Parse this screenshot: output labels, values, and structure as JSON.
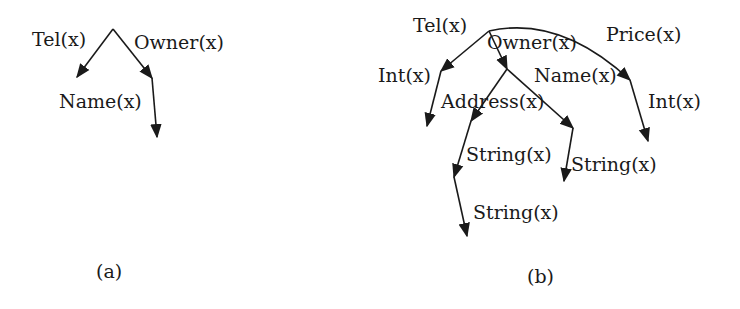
{
  "figure_a": {
    "caption": "(a)",
    "labels": {
      "tel": "Tel(x)",
      "owner": "Owner(x)",
      "name": "Name(x)"
    }
  },
  "figure_b": {
    "caption": "(b)",
    "labels": {
      "tel": "Tel(x)",
      "owner": "Owner(x)",
      "price": "Price(x)",
      "tel_int": "Int(x)",
      "name": "Name(x)",
      "address": "Address(x)",
      "price_int": "Int(x)",
      "address_string": "String(x)",
      "name_string": "String(x)",
      "address_string_2": "String(x)"
    }
  },
  "colors": {
    "ink": "#1a1a1a",
    "background": "#ffffff"
  }
}
